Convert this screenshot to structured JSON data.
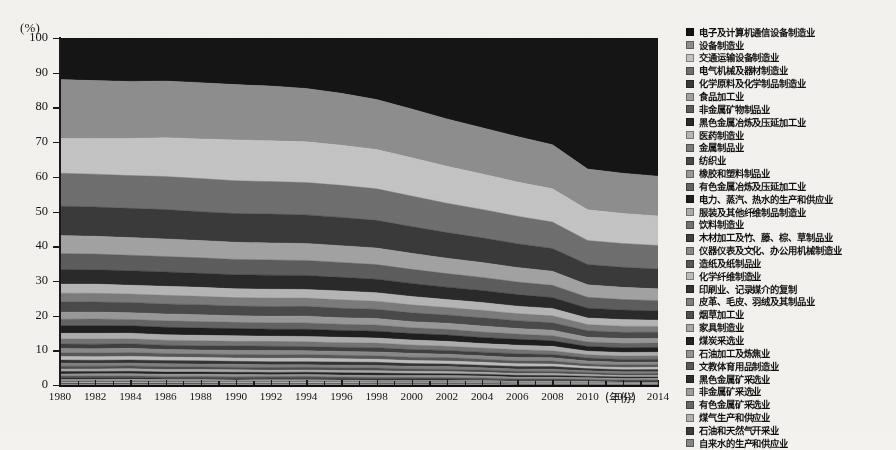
{
  "axes": {
    "y_unit_label": "(%)",
    "y_ticks": [
      "0",
      "10",
      "20",
      "30",
      "40",
      "50",
      "60",
      "70",
      "80",
      "90",
      "100"
    ],
    "x_title": "(年份)",
    "x_ticks": [
      "1980",
      "1982",
      "1984",
      "1986",
      "1988",
      "1990",
      "1992",
      "1994",
      "1996",
      "1998",
      "2000",
      "2002",
      "2004",
      "2006",
      "2008",
      "2010",
      "2012",
      "2014"
    ]
  },
  "legend": {
    "items": [
      {
        "label": "电子及计算机通信设备制造业",
        "color": "#151515"
      },
      {
        "label": "设备制造业",
        "color": "#8e8e8e"
      },
      {
        "label": "交通运输设备制造业",
        "color": "#c4c4c4"
      },
      {
        "label": "电气机械及器材制造业",
        "color": "#6f6f6f"
      },
      {
        "label": "化学原料及化学制品制造业",
        "color": "#3a3a3a"
      },
      {
        "label": "食品加工业",
        "color": "#a2a2a2"
      },
      {
        "label": "非金属矿物制品业",
        "color": "#5d5d5d"
      },
      {
        "label": "黑色金属冶炼及压延加工业",
        "color": "#2a2a2a"
      },
      {
        "label": "医药制造业",
        "color": "#b5b5b5"
      },
      {
        "label": "金属制品业",
        "color": "#7b7b7b"
      },
      {
        "label": "纺织业",
        "color": "#4a4a4a"
      },
      {
        "label": "橡胶和塑料制品业",
        "color": "#989898"
      },
      {
        "label": "有色金属冶炼及压延加工业",
        "color": "#636363"
      },
      {
        "label": "电力、蒸汽、热水的生产和供应业",
        "color": "#1f1f1f"
      },
      {
        "label": "服装及其他纤维制品制造业",
        "color": "#adadad"
      },
      {
        "label": "饮料制造业",
        "color": "#737373"
      },
      {
        "label": "木材加工及竹、藤、棕、草制品业",
        "color": "#404040"
      },
      {
        "label": "仪器仪表及文化、办公用机械制造业",
        "color": "#8a8a8a"
      },
      {
        "label": "造纸及纸制品业",
        "color": "#585858"
      },
      {
        "label": "化学纤维制造业",
        "color": "#bcbcbc"
      },
      {
        "label": "印刷业、记录媒介的复制",
        "color": "#343434"
      },
      {
        "label": "皮革、毛皮、羽绒及其制品业",
        "color": "#7f7f7f"
      },
      {
        "label": "烟草加工业",
        "color": "#4f4f4f"
      },
      {
        "label": "家具制造业",
        "color": "#a8a8a8"
      },
      {
        "label": "煤炭采选业",
        "color": "#242424"
      },
      {
        "label": "石油加工及炼焦业",
        "color": "#949494"
      },
      {
        "label": "文教体育用品制造业",
        "color": "#5a5a5a"
      },
      {
        "label": "黑色金属矿采选业",
        "color": "#2e2e2e"
      },
      {
        "label": "非金属矿采选业",
        "color": "#9e9e9e"
      },
      {
        "label": "有色金属矿采选业",
        "color": "#686868"
      },
      {
        "label": "煤气生产和供应业",
        "color": "#b0b0b0"
      },
      {
        "label": "石油和天然气开采业",
        "color": "#3d3d3d"
      },
      {
        "label": "自来水的生产和供应业",
        "color": "#868686"
      }
    ]
  },
  "chart_data": {
    "type": "area",
    "title": "",
    "xlabel": "(年份)",
    "ylabel": "(%)",
    "ylim": [
      0,
      100
    ],
    "xlim": [
      1980,
      2014
    ],
    "grid": false,
    "legend_position": "right",
    "stacking": "percent",
    "x": [
      1980,
      1982,
      1984,
      1986,
      1988,
      1990,
      1992,
      1994,
      1996,
      1998,
      2000,
      2002,
      2004,
      2006,
      2008,
      2010,
      2012,
      2014
    ],
    "series": [
      {
        "name": "电子及计算机通信设备制造业",
        "color": "#151515",
        "values": [
          12.0,
          12.2,
          12.3,
          12.0,
          12.4,
          12.8,
          13.0,
          13.4,
          14.5,
          16.0,
          18.6,
          21.5,
          24.0,
          26.5,
          29.0,
          36.0,
          37.0,
          37.5
        ]
      },
      {
        "name": "设备制造业",
        "color": "#8e8e8e",
        "values": [
          17.0,
          16.6,
          16.2,
          15.8,
          15.6,
          15.2,
          14.8,
          14.2,
          13.6,
          13.0,
          12.8,
          12.6,
          12.4,
          12.2,
          12.0,
          11.2,
          11.0,
          10.8
        ]
      },
      {
        "name": "交通运输设备制造业",
        "color": "#c4c4c4",
        "values": [
          10.0,
          10.2,
          10.5,
          10.8,
          11.0,
          11.2,
          11.0,
          10.8,
          10.5,
          10.2,
          10.0,
          9.8,
          9.5,
          9.2,
          9.0,
          8.4,
          8.2,
          8.0
        ]
      },
      {
        "name": "电气机械及器材制造业",
        "color": "#6f6f6f",
        "values": [
          9.5,
          9.4,
          9.3,
          9.2,
          9.2,
          9.0,
          8.8,
          8.6,
          8.4,
          8.2,
          8.0,
          7.8,
          7.6,
          7.4,
          7.2,
          6.6,
          6.5,
          6.4
        ]
      },
      {
        "name": "化学原料及化学制品制造业",
        "color": "#3a3a3a",
        "values": [
          8.5,
          8.4,
          8.3,
          8.2,
          8.0,
          7.9,
          7.8,
          7.6,
          7.4,
          7.2,
          7.0,
          6.8,
          6.6,
          6.4,
          6.2,
          5.6,
          5.5,
          5.4
        ]
      },
      {
        "name": "食品加工业",
        "color": "#a2a2a2",
        "values": [
          5.2,
          5.1,
          5.0,
          4.9,
          4.8,
          4.7,
          4.6,
          4.5,
          4.4,
          4.3,
          4.2,
          4.1,
          4.0,
          3.9,
          3.8,
          3.4,
          3.3,
          3.2
        ]
      },
      {
        "name": "非金属矿物制品业",
        "color": "#5d5d5d",
        "values": [
          4.6,
          4.5,
          4.4,
          4.3,
          4.3,
          4.2,
          4.1,
          4.0,
          3.9,
          3.8,
          3.7,
          3.6,
          3.5,
          3.4,
          3.3,
          3.0,
          2.9,
          2.8
        ]
      },
      {
        "name": "黑色金属冶炼及压延加工业",
        "color": "#2a2a2a",
        "values": [
          4.2,
          4.1,
          4.1,
          4.0,
          3.9,
          3.9,
          3.8,
          3.7,
          3.6,
          3.5,
          3.4,
          3.3,
          3.2,
          3.1,
          3.0,
          2.7,
          2.6,
          2.5
        ]
      },
      {
        "name": "医药制造业",
        "color": "#b5b5b5",
        "values": [
          2.6,
          2.6,
          2.5,
          2.5,
          2.5,
          2.4,
          2.4,
          2.3,
          2.3,
          2.2,
          2.2,
          2.1,
          2.1,
          2.0,
          2.0,
          1.8,
          1.8,
          1.7
        ]
      },
      {
        "name": "金属制品业",
        "color": "#7b7b7b",
        "values": [
          2.5,
          2.5,
          2.4,
          2.4,
          2.3,
          2.3,
          2.3,
          2.2,
          2.2,
          2.1,
          2.1,
          2.0,
          2.0,
          1.9,
          1.9,
          1.7,
          1.7,
          1.6
        ]
      },
      {
        "name": "纺织业",
        "color": "#4a4a4a",
        "values": [
          3.0,
          2.9,
          2.9,
          2.8,
          2.8,
          2.7,
          2.6,
          2.6,
          2.5,
          2.4,
          2.3,
          2.2,
          2.2,
          2.1,
          2.0,
          1.8,
          1.7,
          1.7
        ]
      },
      {
        "name": "橡胶和塑料制品业",
        "color": "#989898",
        "values": [
          2.0,
          2.0,
          1.9,
          1.9,
          1.9,
          1.8,
          1.8,
          1.8,
          1.7,
          1.7,
          1.6,
          1.6,
          1.6,
          1.5,
          1.5,
          1.3,
          1.3,
          1.2
        ]
      },
      {
        "name": "有色金属冶炼及压延加工业",
        "color": "#636363",
        "values": [
          1.9,
          1.9,
          1.8,
          1.8,
          1.8,
          1.7,
          1.7,
          1.7,
          1.6,
          1.6,
          1.5,
          1.5,
          1.5,
          1.4,
          1.4,
          1.2,
          1.2,
          1.2
        ]
      },
      {
        "name": "电力、蒸汽、热水的生产和供应业",
        "color": "#1f1f1f",
        "values": [
          2.2,
          2.2,
          2.1,
          2.1,
          2.0,
          2.0,
          1.9,
          1.9,
          1.8,
          1.8,
          1.7,
          1.7,
          1.6,
          1.6,
          1.5,
          1.3,
          1.3,
          1.3
        ]
      },
      {
        "name": "服装及其他纤维制品制造业",
        "color": "#adadad",
        "values": [
          1.6,
          1.6,
          1.6,
          1.5,
          1.5,
          1.5,
          1.4,
          1.4,
          1.4,
          1.3,
          1.3,
          1.3,
          1.2,
          1.2,
          1.2,
          1.0,
          1.0,
          1.0
        ]
      },
      {
        "name": "饮料制造业",
        "color": "#737373",
        "values": [
          1.5,
          1.5,
          1.4,
          1.4,
          1.4,
          1.3,
          1.3,
          1.3,
          1.2,
          1.2,
          1.2,
          1.1,
          1.1,
          1.1,
          1.0,
          0.9,
          0.9,
          0.9
        ]
      },
      {
        "name": "木材加工及竹、藤、棕、草制品业",
        "color": "#404040",
        "values": [
          1.3,
          1.3,
          1.3,
          1.2,
          1.2,
          1.2,
          1.2,
          1.1,
          1.1,
          1.1,
          1.0,
          1.0,
          1.0,
          1.0,
          0.9,
          0.8,
          0.8,
          0.8
        ]
      },
      {
        "name": "仪器仪表及文化、办公用机械制造业",
        "color": "#8a8a8a",
        "values": [
          1.2,
          1.2,
          1.2,
          1.1,
          1.1,
          1.1,
          1.1,
          1.0,
          1.0,
          1.0,
          1.0,
          0.9,
          0.9,
          0.9,
          0.9,
          0.8,
          0.7,
          0.7
        ]
      },
      {
        "name": "造纸及纸制品业",
        "color": "#585858",
        "values": [
          1.1,
          1.1,
          1.1,
          1.0,
          1.0,
          1.0,
          1.0,
          1.0,
          0.9,
          0.9,
          0.9,
          0.9,
          0.8,
          0.8,
          0.8,
          0.7,
          0.7,
          0.7
        ]
      },
      {
        "name": "化学纤维制造业",
        "color": "#bcbcbc",
        "values": [
          1.0,
          1.0,
          1.0,
          1.0,
          0.9,
          0.9,
          0.9,
          0.9,
          0.9,
          0.8,
          0.8,
          0.8,
          0.8,
          0.7,
          0.7,
          0.6,
          0.6,
          0.6
        ]
      },
      {
        "name": "印刷业、记录媒介的复制",
        "color": "#343434",
        "values": [
          0.9,
          0.9,
          0.9,
          0.9,
          0.9,
          0.8,
          0.8,
          0.8,
          0.8,
          0.8,
          0.7,
          0.7,
          0.7,
          0.7,
          0.7,
          0.6,
          0.6,
          0.6
        ]
      },
      {
        "name": "皮革、毛皮、羽绒及其制品业",
        "color": "#7f7f7f",
        "values": [
          0.9,
          0.8,
          0.8,
          0.8,
          0.8,
          0.8,
          0.8,
          0.7,
          0.7,
          0.7,
          0.7,
          0.7,
          0.6,
          0.6,
          0.6,
          0.5,
          0.5,
          0.5
        ]
      },
      {
        "name": "烟草加工业",
        "color": "#4f4f4f",
        "values": [
          0.8,
          0.8,
          0.8,
          0.8,
          0.7,
          0.7,
          0.7,
          0.7,
          0.7,
          0.7,
          0.6,
          0.6,
          0.6,
          0.6,
          0.6,
          0.5,
          0.5,
          0.5
        ]
      },
      {
        "name": "家具制造业",
        "color": "#a8a8a8",
        "values": [
          0.7,
          0.7,
          0.7,
          0.7,
          0.7,
          0.7,
          0.6,
          0.6,
          0.6,
          0.6,
          0.6,
          0.6,
          0.5,
          0.5,
          0.5,
          0.5,
          0.4,
          0.4
        ]
      },
      {
        "name": "煤炭采选业",
        "color": "#242424",
        "values": [
          0.7,
          0.7,
          0.7,
          0.6,
          0.6,
          0.6,
          0.6,
          0.6,
          0.6,
          0.6,
          0.5,
          0.5,
          0.5,
          0.5,
          0.5,
          0.4,
          0.4,
          0.4
        ]
      },
      {
        "name": "石油加工及炼焦业",
        "color": "#949494",
        "values": [
          0.6,
          0.6,
          0.6,
          0.6,
          0.6,
          0.6,
          0.5,
          0.5,
          0.5,
          0.5,
          0.5,
          0.5,
          0.5,
          0.4,
          0.4,
          0.4,
          0.4,
          0.4
        ]
      },
      {
        "name": "文教体育用品制造业",
        "color": "#5a5a5a",
        "values": [
          0.5,
          0.5,
          0.5,
          0.5,
          0.5,
          0.5,
          0.5,
          0.5,
          0.4,
          0.4,
          0.4,
          0.4,
          0.4,
          0.4,
          0.4,
          0.3,
          0.3,
          0.3
        ]
      },
      {
        "name": "黑色金属矿采选业",
        "color": "#2e2e2e",
        "values": [
          0.5,
          0.5,
          0.5,
          0.4,
          0.4,
          0.4,
          0.4,
          0.4,
          0.4,
          0.4,
          0.4,
          0.4,
          0.3,
          0.3,
          0.3,
          0.3,
          0.3,
          0.3
        ]
      },
      {
        "name": "非金属矿采选业",
        "color": "#9e9e9e",
        "values": [
          0.4,
          0.4,
          0.4,
          0.4,
          0.4,
          0.4,
          0.4,
          0.4,
          0.3,
          0.3,
          0.3,
          0.3,
          0.3,
          0.3,
          0.3,
          0.3,
          0.2,
          0.2
        ]
      },
      {
        "name": "有色金属矿采选业",
        "color": "#686868",
        "values": [
          0.4,
          0.4,
          0.4,
          0.3,
          0.3,
          0.3,
          0.3,
          0.3,
          0.3,
          0.3,
          0.3,
          0.3,
          0.3,
          0.2,
          0.2,
          0.2,
          0.2,
          0.2
        ]
      },
      {
        "name": "煤气生产和供应业",
        "color": "#b0b0b0",
        "values": [
          0.3,
          0.3,
          0.3,
          0.3,
          0.3,
          0.3,
          0.3,
          0.3,
          0.3,
          0.2,
          0.2,
          0.2,
          0.2,
          0.2,
          0.2,
          0.2,
          0.2,
          0.2
        ]
      },
      {
        "name": "石油和天然气开采业",
        "color": "#3d3d3d",
        "values": [
          0.3,
          0.3,
          0.3,
          0.3,
          0.3,
          0.2,
          0.2,
          0.2,
          0.2,
          0.2,
          0.2,
          0.2,
          0.2,
          0.2,
          0.2,
          0.2,
          0.1,
          0.1
        ]
      },
      {
        "name": "自来水的生产和供应业",
        "color": "#868686",
        "values": [
          0.2,
          0.2,
          0.2,
          0.2,
          0.2,
          0.2,
          0.2,
          0.2,
          0.2,
          0.2,
          0.2,
          0.2,
          0.2,
          0.1,
          0.1,
          0.1,
          0.1,
          0.1
        ]
      }
    ]
  }
}
